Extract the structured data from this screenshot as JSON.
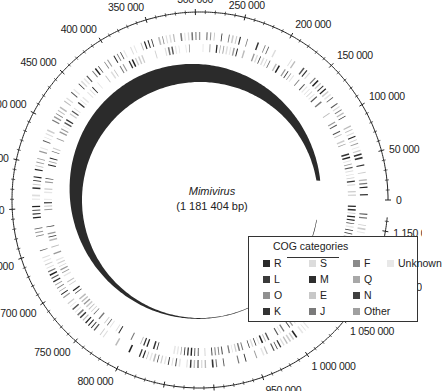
{
  "genome": {
    "name": "Mimivirus",
    "size_label": "(1 181 404 bp)",
    "length_bp": 1181404
  },
  "scale": {
    "labels": [
      {
        "value": 0,
        "text": "0"
      },
      {
        "value": 50000,
        "text": "50 000"
      },
      {
        "value": 100000,
        "text": "100 000"
      },
      {
        "value": 150000,
        "text": "150 000"
      },
      {
        "value": 200000,
        "text": "200 000"
      },
      {
        "value": 250000,
        "text": "250 000"
      },
      {
        "value": 300000,
        "text": "300 000"
      },
      {
        "value": 350000,
        "text": "350 000"
      },
      {
        "value": 400000,
        "text": "400 000"
      },
      {
        "value": 450000,
        "text": "450 000"
      },
      {
        "value": 500000,
        "text": "500 000"
      },
      {
        "value": 550000,
        "text": "550 000"
      },
      {
        "value": 600000,
        "text": "600 000"
      },
      {
        "value": 650000,
        "text": "650 000"
      },
      {
        "value": 700000,
        "text": "700 000"
      },
      {
        "value": 750000,
        "text": "750 000"
      },
      {
        "value": 800000,
        "text": "800 000"
      },
      {
        "value": 850000,
        "text": "850 000"
      },
      {
        "value": 900000,
        "text": "900 000"
      },
      {
        "value": 950000,
        "text": "950 000"
      },
      {
        "value": 1000000,
        "text": "1 000 000"
      },
      {
        "value": 1050000,
        "text": "1 050 000"
      },
      {
        "value": 1100000,
        "text": "1 100 000"
      },
      {
        "value": 1150000,
        "text": "1 150 000"
      }
    ]
  },
  "legend": {
    "title": "COG categories",
    "items": [
      {
        "code": "R",
        "color": "#2a2a2a"
      },
      {
        "code": "S",
        "color": "#dcdcdc"
      },
      {
        "code": "F",
        "color": "#8a8a8a"
      },
      {
        "code": "Unknown",
        "color": "#e8e8e8"
      },
      {
        "code": "L",
        "color": "#3a3a3a"
      },
      {
        "code": "M",
        "color": "#2e2e2e"
      },
      {
        "code": "Q",
        "color": "#a8a8a8"
      },
      {
        "code": "O",
        "color": "#909090"
      },
      {
        "code": "E",
        "color": "#c8c8c8"
      },
      {
        "code": "N",
        "color": "#404040"
      },
      {
        "code": "K",
        "color": "#333333"
      },
      {
        "code": "J",
        "color": "#7a7a7a"
      },
      {
        "code": "Other",
        "color": "#a0a0a0"
      }
    ]
  }
}
